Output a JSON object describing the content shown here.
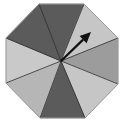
{
  "spinner": {
    "shape": "octagon",
    "sector_count": 8,
    "center": [
      61,
      61
    ],
    "vertices": [
      [
        39,
        4
      ],
      [
        84,
        4
      ],
      [
        118,
        38
      ],
      [
        118,
        84
      ],
      [
        85,
        118
      ],
      [
        40,
        118
      ],
      [
        6,
        83
      ],
      [
        6,
        38
      ]
    ],
    "sectors": [
      {
        "name": "top",
        "color": "#5b5b5b"
      },
      {
        "name": "upper-right",
        "color": "#c6c6c6"
      },
      {
        "name": "right",
        "color": "#9c9c9c"
      },
      {
        "name": "lower-right",
        "color": "#c6c6c6"
      },
      {
        "name": "bottom",
        "color": "#5b5b5b"
      },
      {
        "name": "lower-left",
        "color": "#b6b6b6"
      },
      {
        "name": "left",
        "color": "#c9c9c9"
      },
      {
        "name": "upper-left",
        "color": "#5b5b5b"
      }
    ],
    "outline_color": "#2a2a2a",
    "arrow": {
      "from": [
        61,
        61
      ],
      "to": [
        91,
        32
      ],
      "color": "#111111"
    }
  }
}
